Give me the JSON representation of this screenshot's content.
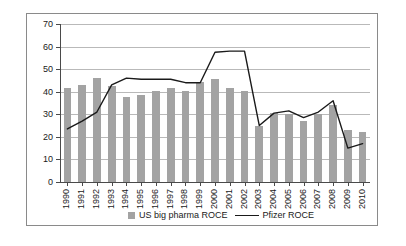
{
  "chart_data": {
    "type": "bar",
    "title": "",
    "subtitle": "",
    "xlabel": "",
    "ylabel": "",
    "ylim": [
      0,
      70
    ],
    "ytick_step": 10,
    "yticks": [
      "0",
      "10",
      "20",
      "30",
      "40",
      "50",
      "60",
      "70"
    ],
    "grid": true,
    "legend_position": "bottom",
    "categories": [
      "1990",
      "1991",
      "1992",
      "1993",
      "1994",
      "1995",
      "1996",
      "1997",
      "1998",
      "1999",
      "2000",
      "2001",
      "2002",
      "2003",
      "2004",
      "2005",
      "2006",
      "2007",
      "2008",
      "2009",
      "2010"
    ],
    "series": [
      {
        "name": "US big pharma ROCE",
        "type": "bar",
        "color": "#a3a3a3",
        "values": [
          41.5,
          43,
          46,
          42.5,
          37.5,
          38.5,
          40.5,
          41.5,
          40.5,
          44.5,
          45.5,
          41.5,
          40.5,
          25,
          30.5,
          30,
          27,
          30,
          34,
          23,
          22
        ]
      },
      {
        "name": "Pfizer ROCE",
        "type": "line",
        "color": "#1a1a1a",
        "values": [
          23.5,
          27,
          31,
          43,
          46,
          45.5,
          45.5,
          45.5,
          44,
          44,
          57.5,
          58,
          58,
          25,
          30.5,
          31.5,
          28.5,
          31,
          36,
          15,
          17
        ]
      }
    ]
  },
  "legend": {
    "bar_label": "US big pharma ROCE",
    "line_label": "Pfizer ROCE"
  }
}
